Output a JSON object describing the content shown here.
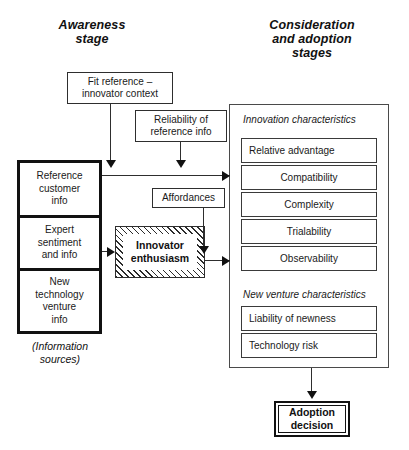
{
  "diagram": {
    "title_left": "Awareness stage",
    "title_right": "Consideration and adoption stages"
  },
  "headings": {
    "left_line1": "Awareness",
    "left_line2": "stage",
    "right_line1": "Consideration",
    "right_line2": "and adoption",
    "right_line3": "stages"
  },
  "top_boxes": [
    {
      "id": "fit-reference",
      "line1": "Fit reference –",
      "line2": "innovator context"
    },
    {
      "id": "reliability",
      "line1": "Reliability of",
      "line2": "reference info"
    }
  ],
  "affordances": {
    "label": "Affordances"
  },
  "information_sources": {
    "caption_line1": "(Information",
    "caption_line2": "sources)",
    "items": [
      {
        "id": "reference-customer-info",
        "line1": "Reference",
        "line2": "customer",
        "line3": "info"
      },
      {
        "id": "expert-sentiment-and-info",
        "line1": "Expert",
        "line2": "sentiment",
        "line3": "and info"
      },
      {
        "id": "new-technology-venture-info",
        "line1": "New",
        "line2": "technology",
        "line3": "venture",
        "line4": "info"
      }
    ]
  },
  "innovator_enthusiasm": {
    "line1": "Innovator",
    "line2": "enthusiasm"
  },
  "right_panel": {
    "group1_heading": "Innovation characteristics",
    "group1_items": [
      {
        "label": "Relative advantage",
        "align": "left"
      },
      {
        "label": "Compatibility",
        "align": "center"
      },
      {
        "label": "Complexity",
        "align": "center"
      },
      {
        "label": "Trialability",
        "align": "center"
      },
      {
        "label": "Observability",
        "align": "center"
      }
    ],
    "group2_heading": "New venture characteristics",
    "group2_items": [
      {
        "label": "Liability of newness",
        "align": "left"
      },
      {
        "label": "Technology risk",
        "align": "left"
      }
    ]
  },
  "adoption": {
    "line1": "Adoption",
    "line2": "decision"
  },
  "colors": {
    "line": "#2e2e2e",
    "heavy": "#111111",
    "panel_border": "#4a4a4a",
    "background": "#ffffff"
  }
}
